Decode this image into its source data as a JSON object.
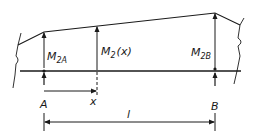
{
  "diagram": {
    "colors": {
      "ink": "#1a1a1a",
      "background": "#ffffff"
    },
    "labels": {
      "m2a_main": "M",
      "m2a_sub": "2A",
      "m2x_main": "M",
      "m2x_sub": "2",
      "m2x_arg": "(x)",
      "m2b_main": "M",
      "m2b_sub": "2B",
      "point_a": "A",
      "point_b": "B",
      "dim_x": "x",
      "dim_l": "l"
    }
  }
}
